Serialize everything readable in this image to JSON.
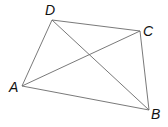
{
  "figure": {
    "type": "quadrilateral-with-diagonals",
    "vertices": [
      {
        "label": "A",
        "x": 22,
        "y": 86
      },
      {
        "label": "B",
        "x": 149,
        "y": 110
      },
      {
        "label": "C",
        "x": 140,
        "y": 31
      },
      {
        "label": "D",
        "x": 52,
        "y": 20
      }
    ],
    "sides": [
      "AB",
      "BC",
      "CD",
      "DA"
    ],
    "diagonals": [
      "AC",
      "BD"
    ],
    "line_color": "#6a6a6a",
    "label_color": "#111111"
  }
}
